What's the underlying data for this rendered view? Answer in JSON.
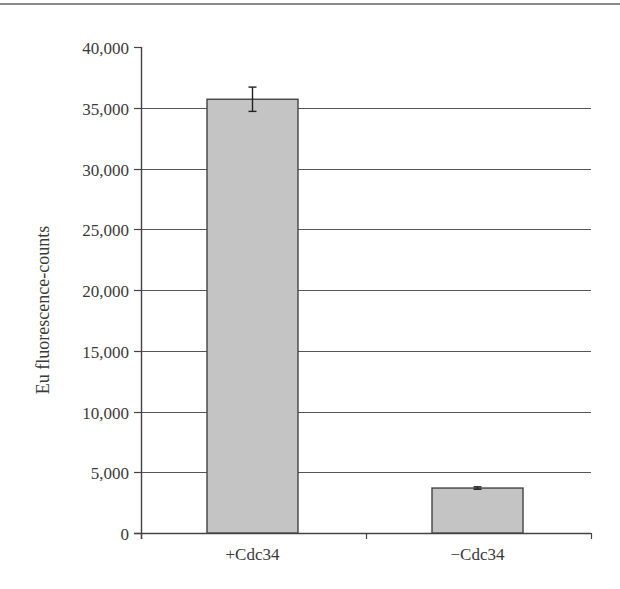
{
  "chart_data": {
    "type": "bar",
    "title": "",
    "xlabel": "",
    "ylabel": "Eu fluorescence-counts",
    "categories": [
      "+Cdc34",
      "−Cdc34"
    ],
    "values": [
      35700,
      3700
    ],
    "error": [
      1000,
      100
    ],
    "ylim": [
      0,
      40000
    ],
    "yticks": [
      0,
      5000,
      10000,
      15000,
      20000,
      25000,
      30000,
      35000,
      40000
    ],
    "ytick_labels": [
      "0",
      "5,000",
      "10,000",
      "15,000",
      "20,000",
      "25,000",
      "30,000",
      "35,000",
      "40,000"
    ],
    "grid": true,
    "legend": null,
    "colors": {
      "bar_fill": "#c4c4c4",
      "bar_edge": "#444444",
      "grid": "#555555",
      "axis": "#444444"
    }
  }
}
